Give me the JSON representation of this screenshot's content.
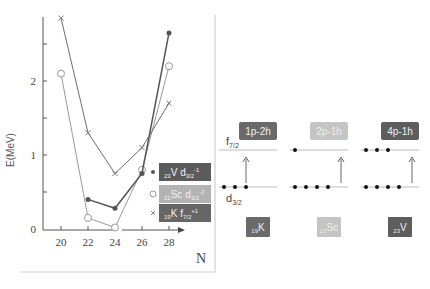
{
  "chart_data": {
    "type": "line",
    "title": "",
    "xlabel": "N",
    "ylabel": "E(MeV)",
    "x": [
      20,
      22,
      24,
      26,
      28
    ],
    "xticks": [
      "20",
      "22",
      "24",
      "26",
      "28"
    ],
    "yticks": [
      "0",
      "1",
      "2"
    ],
    "xlim": [
      18.7,
      29.5
    ],
    "ylim": [
      0,
      3
    ],
    "grid": false,
    "legend_position": "right, inside lower",
    "series": [
      {
        "name": "23V d3/2^-1",
        "marker": "filled-circle",
        "color": "#555555",
        "x": [
          22,
          24,
          26,
          28
        ],
        "values": [
          0.4,
          0.28,
          0.75,
          2.65
        ]
      },
      {
        "name": "21Sc d3/2^-2",
        "marker": "open-circle",
        "color": "#9a9a9a",
        "x": [
          20,
          22,
          24,
          26,
          28
        ],
        "values": [
          2.1,
          0.15,
          0.02,
          0.8,
          2.2
        ]
      },
      {
        "name": "19K f7/2^+1",
        "marker": "cross",
        "color": "#6e6e6e",
        "x": [
          20,
          22,
          24,
          26,
          28
        ],
        "values": [
          2.85,
          1.3,
          0.75,
          1.1,
          1.7
        ]
      }
    ]
  },
  "legend": [
    {
      "prefix": "23",
      "element": "V",
      "orbital": "d",
      "sub": "3/2",
      "sup": "-1",
      "bg": "#5b5b5b"
    },
    {
      "prefix": "21",
      "element": "Sc",
      "orbital": "d",
      "sub": "3/2",
      "sup": "-2",
      "bg": "#b3b3b3"
    },
    {
      "prefix": "19",
      "element": "K",
      "orbital": "f",
      "sub": "7/2",
      "sup": "+1",
      "bg": "#666666"
    }
  ],
  "diagram": {
    "upper_level": {
      "label": "f",
      "sub": "7/2"
    },
    "lower_level": {
      "label": "d",
      "sub": "3/2"
    },
    "columns": [
      {
        "config": "1p-2h",
        "nucleus_prefix": "19",
        "nucleus": "K",
        "upper_dots": 0,
        "lower_dots": 3,
        "box_color": "#6a6a6a"
      },
      {
        "config": "2p-1h",
        "nucleus_prefix": "21",
        "nucleus": "Sc",
        "upper_dots": 1,
        "lower_dots": 4,
        "box_color": "#c4c4c4"
      },
      {
        "config": "4p-1h",
        "nucleus_prefix": "23",
        "nucleus": "V",
        "upper_dots": 3,
        "lower_dots": 4,
        "box_color": "#5e5e5e"
      }
    ]
  }
}
